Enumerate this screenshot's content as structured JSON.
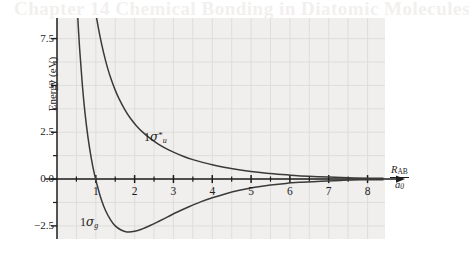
{
  "figure": {
    "ghost_header_text": "Chapter 14  Chemical Bonding in Diatomic Molecules",
    "background_color": "#ffffff",
    "panel_color": "#f0efed",
    "grid_color": "#dcdbd9",
    "axis_color": "#1c1c1c",
    "curve_color": "#3a3a3a"
  },
  "chart_data": {
    "type": "line",
    "title": "",
    "xlabel": "R_AB / a0",
    "ylabel": "Energy (eV)",
    "xlim": [
      0,
      8.45
    ],
    "ylim": [
      -3.2,
      8.6
    ],
    "grid": true,
    "legend": "inline-annotations",
    "x_ticks_major": [
      1,
      2,
      3,
      4,
      5,
      6,
      7,
      8
    ],
    "x_tick_labels": [
      "1",
      "2",
      "3",
      "4",
      "5",
      "6",
      "7",
      "8"
    ],
    "x_ticks_minor": [
      0.5,
      1.5,
      2.5,
      3.5,
      4.5,
      5.5,
      6.5,
      7.5
    ],
    "y_ticks_major": [
      -2.5,
      0.0,
      2.5,
      5,
      7.5
    ],
    "y_tick_labels": [
      "-2.5",
      "0.0",
      "2.5",
      "5",
      "7.5"
    ],
    "y_ticks_minor": [
      -1.25,
      1.25,
      3.75,
      6.25
    ],
    "annotations": [
      {
        "name": "antibonding-label",
        "text": "1σ*u",
        "x": 2.85,
        "y": 2.35
      },
      {
        "name": "bonding-label",
        "text": "1σg",
        "x": 1.45,
        "y": -2.25
      }
    ],
    "series": [
      {
        "name": "1σu*",
        "role": "antibonding",
        "x": [
          0.8,
          0.9,
          1.0,
          1.1,
          1.2,
          1.3,
          1.4,
          1.5,
          1.6,
          1.75,
          1.9,
          2.05,
          2.2,
          2.4,
          2.6,
          2.8,
          3.0,
          3.25,
          3.5,
          3.75,
          4.0,
          4.3,
          4.6,
          5.0,
          5.4,
          5.8,
          6.2,
          6.6,
          7.0,
          7.5,
          8.0,
          8.4
        ],
        "y": [
          12.1,
          10.3,
          8.85,
          7.7,
          6.75,
          5.95,
          5.3,
          4.75,
          4.28,
          3.7,
          3.22,
          2.84,
          2.52,
          2.17,
          1.88,
          1.64,
          1.44,
          1.22,
          1.04,
          0.89,
          0.76,
          0.63,
          0.52,
          0.4,
          0.31,
          0.24,
          0.18,
          0.14,
          0.11,
          0.07,
          0.05,
          0.04
        ]
      },
      {
        "name": "1σg",
        "role": "bonding",
        "x": [
          0.52,
          0.58,
          0.65,
          0.72,
          0.8,
          0.88,
          0.96,
          1.05,
          1.15,
          1.25,
          1.38,
          1.5,
          1.65,
          1.8,
          2.0,
          2.2,
          2.4,
          2.6,
          2.85,
          3.1,
          3.4,
          3.7,
          4.0,
          4.35,
          4.7,
          5.1,
          5.5,
          5.9,
          6.3,
          6.8,
          7.3,
          7.8,
          8.4
        ],
        "y": [
          9.2,
          7.05,
          5.1,
          3.55,
          2.2,
          1.15,
          0.3,
          -0.45,
          -1.15,
          -1.68,
          -2.18,
          -2.5,
          -2.72,
          -2.82,
          -2.79,
          -2.66,
          -2.48,
          -2.28,
          -2.02,
          -1.76,
          -1.48,
          -1.22,
          -1.0,
          -0.78,
          -0.6,
          -0.44,
          -0.32,
          -0.23,
          -0.17,
          -0.11,
          -0.07,
          -0.04,
          -0.03
        ]
      }
    ]
  },
  "axis": {
    "y_label": "Energy (eV)",
    "x_label_numerator": "R",
    "x_label_numerator_sub": "AB",
    "x_label_denominator": "a",
    "x_label_denominator_sub": "0"
  },
  "labels": {
    "antibonding": {
      "prefix": "1",
      "sigma": "σ",
      "star": "*",
      "sub": "u"
    },
    "bonding": {
      "prefix": "1",
      "sigma": "σ",
      "sub": "g"
    }
  }
}
